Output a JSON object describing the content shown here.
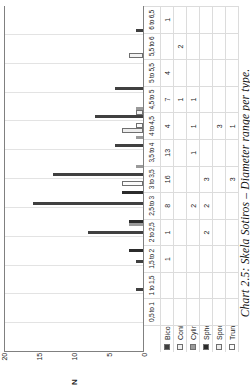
{
  "caption": "Chart 2.5: Skela Sotiros – Diameter range per type.",
  "axis": {
    "ylabel": "N",
    "yticks": [
      "0",
      "5",
      "10",
      "15",
      "20"
    ],
    "ymin": 0,
    "ymax": 20
  },
  "legend": {
    "items": [
      {
        "label": "Biconical",
        "swatch": "#404040"
      },
      {
        "label": "Conical",
        "swatch": "#f2f2f2"
      },
      {
        "label": "Cylindrical",
        "swatch": "#9a9a9a"
      },
      {
        "label": "Spheroid",
        "swatch": "#2b2b2b"
      },
      {
        "label": "Spool",
        "swatch": "#ededed"
      },
      {
        "label": "Truncated cone",
        "swatch": "#fbfbfb"
      }
    ]
  },
  "chart_data": {
    "type": "bar",
    "title": "Chart 2.5: Skela Sotiros – Diameter range per type.",
    "xlabel": "",
    "ylabel": "N",
    "ylim": [
      0,
      20
    ],
    "grid": true,
    "legend_position": "bottom",
    "categories": [
      "0,5 to 1",
      "1 to 1,5",
      "1,5 to 2",
      "2 to 2,5",
      "2,5 to 3",
      "3 to 3,5",
      "3,5 to 4",
      "4 to 4,5",
      "4,5 to 5",
      "5 to 5,5",
      "5,5 to 6",
      "6 to 6,5"
    ],
    "series": [
      {
        "name": "Biconical",
        "values": [
          null,
          null,
          1,
          1,
          8,
          16,
          13,
          4,
          7,
          4,
          null,
          1
        ]
      },
      {
        "name": "Conical",
        "values": [
          null,
          null,
          null,
          null,
          null,
          null,
          null,
          null,
          1,
          null,
          2,
          null
        ]
      },
      {
        "name": "Cylindrical",
        "values": [
          null,
          null,
          null,
          null,
          2,
          null,
          1,
          1,
          1,
          null,
          null,
          null
        ]
      },
      {
        "name": "Spheroid",
        "values": [
          null,
          null,
          null,
          2,
          2,
          3,
          null,
          null,
          null,
          null,
          null,
          null
        ]
      },
      {
        "name": "Spool",
        "values": [
          null,
          null,
          null,
          null,
          null,
          null,
          null,
          3,
          null,
          null,
          null,
          null
        ]
      },
      {
        "name": "Truncated cone",
        "values": [
          null,
          null,
          null,
          null,
          null,
          3,
          null,
          1,
          null,
          null,
          null,
          null
        ]
      }
    ]
  },
  "table": {
    "col_headers": [
      "0,5 to 1",
      "1 to 1,5",
      "1,5 to 2",
      "2 to 2,5",
      "2,5 to 3",
      "3 to 3,5",
      "3,5 to 4",
      "4 to 4,5",
      "4,5 to 5",
      "5 to 5,5",
      "5,5 to 6",
      "6 to 6,5"
    ],
    "rows": [
      {
        "label": "Biconical",
        "cells": [
          "",
          "",
          "1",
          "1",
          "8",
          "16",
          "13",
          "4",
          "7",
          "4",
          "",
          "1"
        ]
      },
      {
        "label": "Conical",
        "cells": [
          "",
          "",
          "",
          "",
          "",
          "",
          "",
          "",
          "1",
          "",
          "2",
          ""
        ]
      },
      {
        "label": "Cylindrical",
        "cells": [
          "",
          "",
          "",
          "",
          "2",
          "",
          "1",
          "1",
          "1",
          "",
          "",
          ""
        ]
      },
      {
        "label": "Spheroid",
        "cells": [
          "",
          "",
          "",
          "2",
          "2",
          "3",
          "",
          "",
          "",
          "",
          "",
          ""
        ]
      },
      {
        "label": "Spool",
        "cells": [
          "",
          "",
          "",
          "",
          "",
          "",
          "",
          "3",
          "",
          "",
          "",
          ""
        ]
      },
      {
        "label": "Truncated cone",
        "cells": [
          "",
          "",
          "",
          "",
          "",
          "3",
          "",
          "1",
          "",
          "",
          "",
          ""
        ]
      }
    ]
  }
}
